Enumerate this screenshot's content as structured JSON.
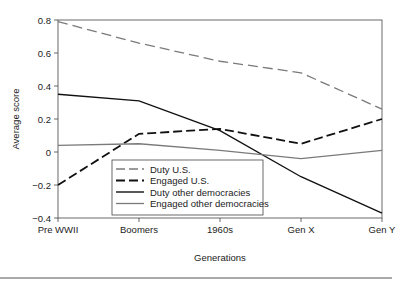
{
  "chart_data": {
    "type": "line",
    "title": "",
    "xlabel": "Generations",
    "ylabel": "Average score",
    "categories": [
      "Pre WWII",
      "Boomers",
      "1960s",
      "Gen X",
      "Gen Y"
    ],
    "ylim": [
      -0.4,
      0.8
    ],
    "yticks": [
      0.8,
      0.6,
      0.4,
      0.2,
      0,
      -0.2,
      -0.4
    ],
    "ytick_labels": [
      "0.8",
      "0.6",
      "0.4",
      "0.2",
      "0",
      "−0.2",
      "−0.4"
    ],
    "grid": false,
    "legend_position": "lower-left inside plot",
    "series": [
      {
        "name": "Duty U.S.",
        "values": [
          0.79,
          0.66,
          0.55,
          0.48,
          0.26
        ],
        "color": "#7a7a7a",
        "style": "dashed",
        "width": 1.3
      },
      {
        "name": "Engaged U.S.",
        "values": [
          -0.2,
          0.11,
          0.14,
          0.05,
          0.2
        ],
        "color": "#111111",
        "style": "dashed",
        "width": 1.8
      },
      {
        "name": "Duty other democracies",
        "values": [
          0.35,
          0.31,
          0.13,
          -0.15,
          -0.37
        ],
        "color": "#111111",
        "style": "solid",
        "width": 1.4
      },
      {
        "name": "Engaged other democracies",
        "values": [
          0.04,
          0.05,
          0.01,
          -0.04,
          0.01
        ],
        "color": "#7a7a7a",
        "style": "solid",
        "width": 1.3
      }
    ]
  }
}
